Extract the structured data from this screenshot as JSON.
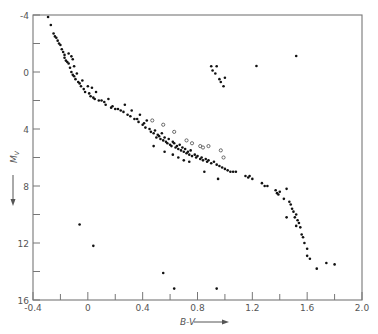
{
  "chart_data": {
    "type": "scatter",
    "title": "",
    "xlabel": "B-V",
    "ylabel": "M_V",
    "xlim": [
      -0.4,
      2.0
    ],
    "ylim": [
      16,
      -4
    ],
    "y_inverted": true,
    "grid": false,
    "legend": null,
    "x_ticks": [
      -0.4,
      -0.2,
      0,
      0.2,
      0.4,
      0.6,
      0.8,
      1.0,
      1.2,
      1.4,
      1.6,
      1.8,
      2.0
    ],
    "x_tick_labels": [
      "-0.4",
      "",
      "0",
      "",
      "0.4",
      "",
      "0.8",
      "",
      "1.2",
      "",
      "1.6",
      "",
      "2.0"
    ],
    "y_ticks": [
      -4,
      -2,
      0,
      2,
      4,
      6,
      8,
      10,
      12,
      14,
      16
    ],
    "y_tick_labels": [
      "-4",
      "",
      "0",
      "",
      "4",
      "",
      "8",
      "",
      "12",
      "",
      "16"
    ],
    "series": [
      {
        "name": "filled",
        "marker": "filled-circle",
        "points": [
          [
            -0.29,
            -3.86
          ],
          [
            -0.27,
            -3.3
          ],
          [
            -0.25,
            -2.7
          ],
          [
            -0.24,
            -2.5
          ],
          [
            -0.23,
            -2.4
          ],
          [
            -0.22,
            -2.2
          ],
          [
            -0.21,
            -2.0
          ],
          [
            -0.2,
            -1.9
          ],
          [
            -0.19,
            -1.6
          ],
          [
            -0.18,
            -1.4
          ],
          [
            -0.17,
            -1.2
          ],
          [
            -0.17,
            -1.0
          ],
          [
            -0.16,
            -0.8
          ],
          [
            -0.15,
            -0.7
          ],
          [
            -0.14,
            -0.6
          ],
          [
            -0.14,
            -1.3
          ],
          [
            -0.12,
            -1.1
          ],
          [
            -0.11,
            -0.9
          ],
          [
            -0.13,
            -0.3
          ],
          [
            -0.12,
            0.0
          ],
          [
            -0.11,
            0.2
          ],
          [
            -0.1,
            0.3
          ],
          [
            -0.09,
            0.5
          ],
          [
            -0.1,
            -0.4
          ],
          [
            -0.08,
            0.1
          ],
          [
            -0.07,
            0.7
          ],
          [
            -0.06,
            0.8
          ],
          [
            -0.05,
            1.0
          ],
          [
            -0.04,
            0.6
          ],
          [
            -0.03,
            1.2
          ],
          [
            -0.02,
            1.4
          ],
          [
            0.0,
            1.0
          ],
          [
            0.01,
            1.5
          ],
          [
            0.02,
            1.7
          ],
          [
            0.03,
            1.1
          ],
          [
            0.04,
            1.8
          ],
          [
            0.05,
            1.9
          ],
          [
            0.06,
            1.4
          ],
          [
            0.08,
            2.0
          ],
          [
            0.1,
            2.0
          ],
          [
            0.12,
            2.1
          ],
          [
            0.13,
            2.3
          ],
          [
            0.15,
            1.9
          ],
          [
            0.17,
            2.5
          ],
          [
            0.18,
            2.4
          ],
          [
            0.2,
            2.6
          ],
          [
            0.22,
            2.6
          ],
          [
            0.24,
            2.7
          ],
          [
            0.26,
            2.8
          ],
          [
            0.27,
            2.3
          ],
          [
            0.29,
            3.0
          ],
          [
            0.31,
            3.1
          ],
          [
            0.32,
            2.7
          ],
          [
            0.34,
            3.3
          ],
          [
            0.36,
            3.3
          ],
          [
            0.37,
            3.5
          ],
          [
            0.38,
            3.0
          ],
          [
            0.4,
            3.7
          ],
          [
            0.41,
            3.6
          ],
          [
            0.42,
            3.9
          ],
          [
            0.43,
            3.4
          ],
          [
            0.45,
            4.0
          ],
          [
            0.46,
            4.2
          ],
          [
            0.48,
            4.3
          ],
          [
            0.49,
            4.1
          ],
          [
            0.5,
            4.6
          ],
          [
            0.51,
            4.4
          ],
          [
            0.52,
            4.5
          ],
          [
            0.53,
            4.7
          ],
          [
            0.54,
            4.3
          ],
          [
            0.55,
            4.8
          ],
          [
            0.56,
            4.6
          ],
          [
            0.57,
            4.9
          ],
          [
            0.58,
            5.0
          ],
          [
            0.59,
            4.7
          ],
          [
            0.6,
            5.1
          ],
          [
            0.61,
            5.2
          ],
          [
            0.62,
            4.9
          ],
          [
            0.63,
            5.0
          ],
          [
            0.64,
            5.3
          ],
          [
            0.65,
            5.2
          ],
          [
            0.66,
            5.4
          ],
          [
            0.67,
            5.1
          ],
          [
            0.68,
            5.5
          ],
          [
            0.69,
            5.3
          ],
          [
            0.7,
            5.6
          ],
          [
            0.71,
            5.4
          ],
          [
            0.72,
            5.7
          ],
          [
            0.73,
            5.6
          ],
          [
            0.74,
            5.8
          ],
          [
            0.75,
            5.5
          ],
          [
            0.76,
            5.9
          ],
          [
            0.78,
            5.8
          ],
          [
            0.79,
            6.0
          ],
          [
            0.8,
            5.9
          ],
          [
            0.82,
            6.1
          ],
          [
            0.83,
            6.0
          ],
          [
            0.84,
            6.2
          ],
          [
            0.86,
            6.1
          ],
          [
            0.87,
            6.3
          ],
          [
            0.88,
            6.2
          ],
          [
            0.9,
            6.4
          ],
          [
            0.92,
            6.3
          ],
          [
            0.94,
            6.5
          ],
          [
            0.96,
            6.6
          ],
          [
            0.98,
            6.7
          ],
          [
            1.0,
            6.8
          ],
          [
            1.02,
            6.9
          ],
          [
            1.04,
            7.0
          ],
          [
            1.06,
            7.0
          ],
          [
            1.08,
            7.0
          ],
          [
            0.62,
            5.8
          ],
          [
            0.66,
            6.0
          ],
          [
            0.7,
            6.2
          ],
          [
            0.74,
            6.3
          ],
          [
            0.56,
            5.6
          ],
          [
            0.48,
            5.2
          ],
          [
            0.85,
            7.0
          ],
          [
            0.95,
            7.5
          ],
          [
            1.15,
            7.3
          ],
          [
            1.17,
            7.4
          ],
          [
            1.18,
            7.3
          ],
          [
            1.2,
            7.5
          ],
          [
            1.27,
            7.8
          ],
          [
            1.29,
            8.0
          ],
          [
            1.31,
            8.0
          ],
          [
            1.37,
            8.3
          ],
          [
            1.38,
            8.5
          ],
          [
            1.39,
            8.6
          ],
          [
            1.4,
            8.4
          ],
          [
            1.43,
            8.9
          ],
          [
            1.45,
            8.2
          ],
          [
            1.47,
            9.1
          ],
          [
            1.48,
            9.3
          ],
          [
            1.49,
            9.6
          ],
          [
            1.5,
            9.8
          ],
          [
            1.51,
            10.2
          ],
          [
            1.52,
            10.0
          ],
          [
            1.53,
            10.4
          ],
          [
            1.54,
            10.6
          ],
          [
            1.55,
            10.9
          ],
          [
            1.52,
            10.8
          ],
          [
            1.56,
            11.4
          ],
          [
            1.57,
            11.6
          ],
          [
            1.58,
            12.0
          ],
          [
            1.6,
            12.4
          ],
          [
            1.6,
            12.9
          ],
          [
            1.62,
            13.1
          ],
          [
            1.67,
            13.8
          ],
          [
            1.74,
            13.4
          ],
          [
            1.8,
            13.5
          ],
          [
            1.45,
            10.2
          ],
          [
            0.9,
            -0.4
          ],
          [
            0.91,
            -0.1
          ],
          [
            0.93,
            0.1
          ],
          [
            0.94,
            -0.4
          ],
          [
            0.96,
            0.5
          ],
          [
            0.97,
            0.7
          ],
          [
            0.99,
            1.0
          ],
          [
            1.0,
            0.4
          ],
          [
            1.23,
            -0.42
          ],
          [
            1.52,
            -1.12
          ],
          [
            -0.06,
            10.7
          ],
          [
            0.04,
            12.2
          ],
          [
            0.55,
            14.1
          ],
          [
            0.63,
            15.2
          ],
          [
            0.94,
            15.2
          ]
        ]
      },
      {
        "name": "open",
        "marker": "open-circle",
        "points": [
          [
            0.47,
            3.4
          ],
          [
            0.55,
            3.7
          ],
          [
            0.63,
            4.2
          ],
          [
            0.72,
            4.8
          ],
          [
            0.76,
            5.0
          ],
          [
            0.82,
            5.2
          ],
          [
            0.84,
            5.3
          ],
          [
            0.88,
            5.2
          ],
          [
            0.97,
            5.5
          ],
          [
            0.99,
            6.0
          ]
        ]
      }
    ]
  }
}
